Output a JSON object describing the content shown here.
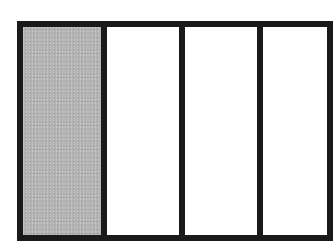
{
  "diagram": {
    "type": "fraction-bar",
    "total_parts": 4,
    "shaded_parts": 1,
    "parts": [
      {
        "index": 1,
        "shaded": true,
        "width": 78
      },
      {
        "index": 2,
        "shaded": false,
        "width": 78
      },
      {
        "index": 3,
        "shaded": false,
        "width": 78
      },
      {
        "index": 4,
        "shaded": false,
        "width": 76
      }
    ],
    "colors": {
      "border": "#1a1a1a",
      "shaded_fill": "#b3b3b3",
      "unshaded_fill": "#ffffff"
    }
  }
}
